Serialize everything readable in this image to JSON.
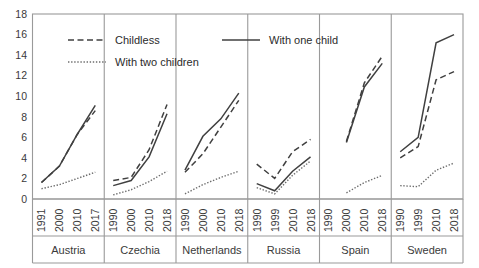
{
  "chart_data": {
    "type": "line",
    "title": "",
    "subtitle": "",
    "xlabel": "",
    "ylabel": "",
    "ylim": [
      0,
      18
    ],
    "ytick_values": [
      0,
      2,
      4,
      6,
      8,
      10,
      12,
      14,
      16,
      18
    ],
    "ytick_labels": [
      "0",
      "2",
      "4",
      "6",
      "8",
      "10",
      "12",
      "14",
      "16",
      "18"
    ],
    "grid": false,
    "legend_position": "top-inside",
    "legend": [
      {
        "name": "Childless",
        "style": "dashed"
      },
      {
        "name": "With one child",
        "style": "solid"
      },
      {
        "name": "With two children",
        "style": "dotted"
      }
    ],
    "panels": [
      {
        "name": "Austria",
        "x": [
          "1991",
          "2000",
          "2010",
          "2017"
        ],
        "series": [
          {
            "name": "Childless",
            "style": "dashed",
            "values": [
              1.6,
              3.2,
              6.3,
              8.6
            ]
          },
          {
            "name": "With one child",
            "style": "solid",
            "values": [
              1.6,
              3.2,
              6.3,
              9.1
            ]
          },
          {
            "name": "With two children",
            "style": "dotted",
            "values": [
              1.0,
              1.4,
              2.0,
              2.6
            ]
          }
        ]
      },
      {
        "name": "Czechia",
        "x": [
          "1990",
          "2000",
          "2010",
          "2018"
        ],
        "series": [
          {
            "name": "Childless",
            "style": "dashed",
            "values": [
              1.8,
              2.1,
              4.8,
              9.2
            ]
          },
          {
            "name": "With one child",
            "style": "solid",
            "values": [
              1.3,
              1.8,
              4.1,
              8.3
            ]
          },
          {
            "name": "With two children",
            "style": "dotted",
            "values": [
              0.4,
              0.9,
              1.7,
              2.7
            ]
          }
        ]
      },
      {
        "name": "Netherlands",
        "x": [
          "1990",
          "2000",
          "2010",
          "2018"
        ],
        "series": [
          {
            "name": "Childless",
            "style": "dashed",
            "values": [
              2.6,
              4.4,
              7.0,
              9.6
            ]
          },
          {
            "name": "With one child",
            "style": "solid",
            "values": [
              2.8,
              6.1,
              7.8,
              10.3
            ]
          },
          {
            "name": "With two children",
            "style": "dotted",
            "values": [
              0.5,
              1.4,
              2.1,
              2.7
            ]
          }
        ]
      },
      {
        "name": "Russia",
        "x": [
          "1990",
          "1999",
          "2010",
          "2018"
        ],
        "series": [
          {
            "name": "Childless",
            "style": "dashed",
            "values": [
              3.4,
              2.0,
              4.6,
              5.8
            ]
          },
          {
            "name": "With one child",
            "style": "solid",
            "values": [
              1.5,
              0.8,
              2.7,
              4.1
            ]
          },
          {
            "name": "With two children",
            "style": "dotted",
            "values": [
              1.1,
              0.5,
              2.3,
              3.7
            ]
          }
        ]
      },
      {
        "name": "Spain",
        "x": [
          "1990",
          "2000",
          "2010",
          "2018"
        ],
        "series": [
          {
            "name": "Childless",
            "style": "dashed",
            "values": [
              null,
              5.6,
              11.3,
              13.9
            ]
          },
          {
            "name": "With one child",
            "style": "solid",
            "values": [
              null,
              5.5,
              10.9,
              13.2
            ]
          },
          {
            "name": "With two children",
            "style": "dotted",
            "values": [
              null,
              0.6,
              1.6,
              2.3
            ]
          }
        ]
      },
      {
        "name": "Sweden",
        "x": [
          "1990",
          "1999",
          "2010",
          "2018"
        ],
        "series": [
          {
            "name": "Childless",
            "style": "dashed",
            "values": [
              4.0,
              5.1,
              11.6,
              12.4
            ]
          },
          {
            "name": "With one child",
            "style": "solid",
            "values": [
              4.6,
              6.0,
              15.2,
              16.0
            ]
          },
          {
            "name": "With two children",
            "style": "dotted",
            "values": [
              1.3,
              1.2,
              2.8,
              3.5
            ]
          }
        ]
      }
    ]
  }
}
